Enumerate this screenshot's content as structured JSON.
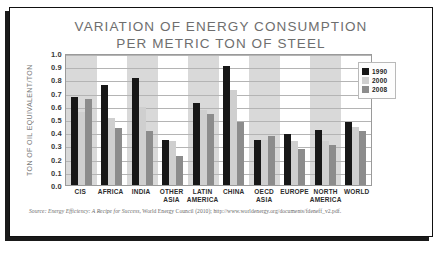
{
  "chart_data": {
    "type": "bar",
    "title": "VARIATION OF ENERGY CONSUMPTION PER METRIC TON OF STEEL",
    "title_line1": "VARIATION OF ENERGY CONSUMPTION",
    "title_line2": "PER METRIC TON OF STEEL",
    "xlabel": "",
    "ylabel": "TON OF OIL EQUIVALENT/TON",
    "ylim": [
      0.0,
      1.0
    ],
    "ytick_labels": [
      "1.0",
      "0.9",
      "0.8",
      "0.7",
      "0.6",
      "0.5",
      "0.4",
      "0.3",
      "0.2",
      "0.1",
      "0.0"
    ],
    "ytick_values": [
      1.0,
      0.9,
      0.8,
      0.7,
      0.6,
      0.5,
      0.4,
      0.3,
      0.2,
      0.1,
      0.0
    ],
    "grid": true,
    "legend_position": "right",
    "categories": [
      "CIS",
      "AFRICA",
      "INDIA",
      "OTHER ASIA",
      "LATIN AMERICA",
      "CHINA",
      "OECD ASIA",
      "EUROPE",
      "NORTH AMERICA",
      "WORLD"
    ],
    "category_lines": [
      [
        "CIS"
      ],
      [
        "AFRICA"
      ],
      [
        "INDIA"
      ],
      [
        "OTHER",
        "ASIA"
      ],
      [
        "LATIN",
        "AMERICA"
      ],
      [
        "CHINA"
      ],
      [
        "OECD",
        "ASIA"
      ],
      [
        "EUROPE"
      ],
      [
        "NORTH",
        "AMERICA"
      ],
      [
        "WORLD"
      ]
    ],
    "series": [
      {
        "name": "1990",
        "color": "#171717",
        "values": [
          0.67,
          0.76,
          0.81,
          0.34,
          0.62,
          0.9,
          0.34,
          0.39,
          0.42,
          0.48
        ]
      },
      {
        "name": "2000",
        "color": "#cfcfcf",
        "values": [
          0.55,
          0.51,
          0.59,
          0.33,
          0.57,
          0.72,
          0.34,
          0.33,
          0.33,
          0.44
        ]
      },
      {
        "name": "2008",
        "color": "#8c8c8c",
        "values": [
          0.65,
          0.43,
          0.41,
          0.22,
          0.54,
          0.48,
          0.37,
          0.27,
          0.3,
          0.41
        ]
      }
    ]
  },
  "legend": {
    "entries": [
      {
        "label": "1990"
      },
      {
        "label": "2000"
      },
      {
        "label": "2008"
      }
    ]
  },
  "source": {
    "label": "Source:",
    "title": "Energy Efficiency: A Recipe for Success,",
    "rest": "World Energy Council (2010); http://www.worldenergy.org/documents/fdeneff_v2.pdf."
  }
}
